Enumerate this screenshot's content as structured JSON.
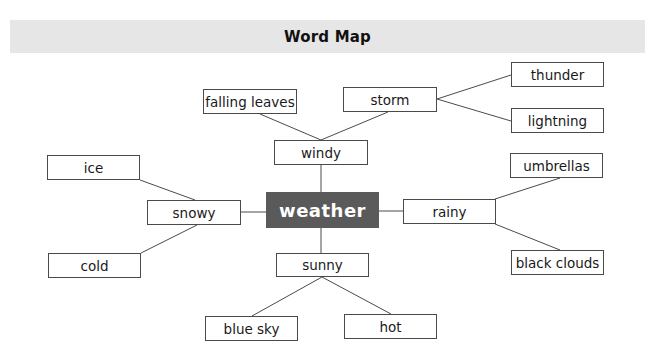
{
  "header": {
    "title": "Word Map"
  },
  "center": {
    "label": "weather",
    "fill": "#5a5a5a",
    "text_color": "#ffffff"
  },
  "nodes": {
    "windy": "windy",
    "falling_leaves": "falling leaves",
    "storm": "storm",
    "thunder": "thunder",
    "lightning": "lightning",
    "snowy": "snowy",
    "ice": "ice",
    "cold": "cold",
    "rainy": "rainy",
    "umbrellas": "umbrellas",
    "black_clouds": "black clouds",
    "sunny": "sunny",
    "blue_sky": "blue sky",
    "hot": "hot"
  },
  "edges": [
    [
      "weather",
      "windy"
    ],
    [
      "windy",
      "falling leaves"
    ],
    [
      "windy",
      "storm"
    ],
    [
      "storm",
      "thunder"
    ],
    [
      "storm",
      "lightning"
    ],
    [
      "weather",
      "snowy"
    ],
    [
      "snowy",
      "ice"
    ],
    [
      "snowy",
      "cold"
    ],
    [
      "weather",
      "rainy"
    ],
    [
      "rainy",
      "umbrellas"
    ],
    [
      "rainy",
      "black clouds"
    ],
    [
      "weather",
      "sunny"
    ],
    [
      "sunny",
      "blue sky"
    ],
    [
      "sunny",
      "hot"
    ]
  ]
}
